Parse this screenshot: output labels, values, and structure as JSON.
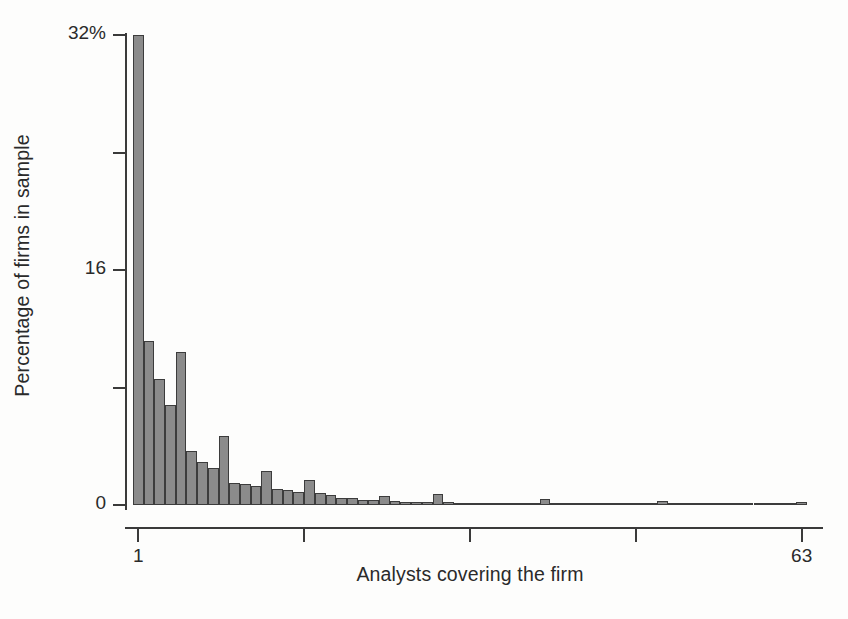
{
  "chart_data": {
    "type": "bar",
    "title": "",
    "subtitle": "",
    "xlabel": "Analysts covering the firm",
    "ylabel": "Percentage of firms in sample",
    "grid": false,
    "legend": null,
    "xlim": [
      1,
      63
    ],
    "ylim": [
      0,
      32
    ],
    "y_tick_values": [
      0,
      8,
      16,
      24,
      32
    ],
    "y_tick_labels": [
      "0",
      "",
      "16",
      "",
      "32%"
    ],
    "x_tick_values": [
      1,
      16.5,
      32,
      47.5,
      63
    ],
    "x_tick_labels": [
      "1",
      "",
      "",
      "",
      "63"
    ],
    "xlabel_axis_suffix": "%",
    "bar_fill_color": "#8b8b8b",
    "bar_edge_color": "#3c3c3c",
    "axis_color": "#3a3a3a",
    "background_color": "#fdfdfc",
    "categories": [
      1,
      2,
      3,
      4,
      5,
      6,
      7,
      8,
      9,
      10,
      11,
      12,
      13,
      14,
      15,
      16,
      17,
      18,
      19,
      20,
      21,
      22,
      23,
      24,
      25,
      26,
      27,
      28,
      29,
      30,
      31,
      32,
      33,
      34,
      35,
      36,
      37,
      38,
      39,
      40,
      41,
      42,
      43,
      44,
      45,
      46,
      47,
      48,
      49,
      50,
      51,
      52,
      53,
      54,
      55,
      56,
      57,
      58,
      59,
      60,
      61,
      62,
      63
    ],
    "values": [
      32.0,
      11.2,
      8.6,
      6.8,
      10.4,
      3.7,
      2.9,
      2.5,
      4.7,
      1.5,
      1.4,
      1.3,
      2.3,
      1.1,
      1.0,
      0.9,
      1.7,
      0.8,
      0.7,
      0.45,
      0.5,
      0.35,
      0.35,
      0.6,
      0.25,
      0.2,
      0.2,
      0.2,
      0.75,
      0.2,
      0.15,
      0.15,
      0.15,
      0.1,
      0.1,
      0.1,
      0.1,
      0.1,
      0.4,
      0.1,
      0.1,
      0.1,
      0.1,
      0.1,
      0.05,
      0.0,
      0.0,
      0.0,
      0.0,
      0.25,
      0.0,
      0.0,
      0.0,
      0.0,
      0.0,
      0.0,
      0.0,
      0.0,
      0.0,
      0.0,
      0.0,
      0.0,
      0.2
    ]
  },
  "axes": {
    "y_label": "Percentage of firms in sample",
    "x_label": "Analysts covering the firm",
    "y_labels": [
      {
        "value": 32,
        "text": "32%"
      },
      {
        "value": 24,
        "text": ""
      },
      {
        "value": 16,
        "text": "16"
      },
      {
        "value": 8,
        "text": ""
      },
      {
        "value": 0,
        "text": "0"
      }
    ],
    "x_labels": [
      {
        "value": 1,
        "text": "1"
      },
      {
        "value": 63,
        "text": "63"
      }
    ]
  }
}
